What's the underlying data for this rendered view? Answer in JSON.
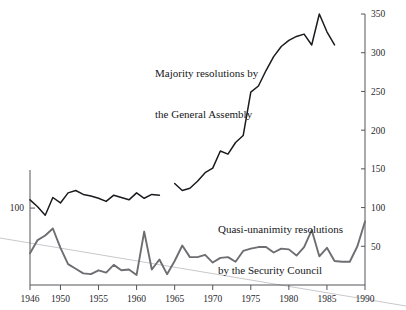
{
  "chart_data": {
    "type": "line",
    "title": "",
    "subtitle": "",
    "xlabel": "",
    "ylabel": "",
    "xlim": [
      1946,
      1990
    ],
    "grid": false,
    "legend_position": "inline-annotations",
    "axes": {
      "right": {
        "label": "",
        "ylim": [
          0,
          350
        ],
        "ticks": [
          50,
          100,
          150,
          200,
          250,
          300,
          350
        ],
        "tick_labels": [
          "50",
          "100",
          "150",
          "200",
          "250",
          "300",
          "350"
        ]
      },
      "left": {
        "label": "",
        "ticks": [
          100
        ],
        "tick_labels": [
          "100"
        ]
      },
      "bottom": {
        "ticks": [
          1946,
          1950,
          1955,
          1960,
          1965,
          1970,
          1975,
          1980,
          1985,
          1990
        ],
        "tick_labels": [
          "1946",
          "1950",
          "1955",
          "1960",
          "1965",
          "1970",
          "1975",
          "1980",
          "1985",
          "1990"
        ]
      }
    },
    "annotations": [
      {
        "name": "general-assembly-label",
        "line1": "Majority resolutions by",
        "line2": "the General Assembly"
      },
      {
        "name": "security-council-label",
        "line1": "Quasi-unanimity resolutions",
        "line2": "by the Security Council"
      }
    ],
    "series": [
      {
        "name": "Majority resolutions by the General Assembly",
        "color": "#1b1b1f",
        "x": [
          1946,
          1947,
          1948,
          1949,
          1950,
          1951,
          1952,
          1953,
          1954,
          1955,
          1956,
          1957,
          1958,
          1959,
          1960,
          1961,
          1962,
          1963,
          1965,
          1966,
          1967,
          1968,
          1969,
          1970,
          1971,
          1972,
          1973,
          1974,
          1975,
          1976,
          1977,
          1978,
          1979,
          1980,
          1981,
          1982,
          1983,
          1984,
          1985,
          1986
        ],
        "values": [
          110,
          101,
          90,
          113,
          106,
          119,
          122,
          117,
          115,
          112,
          108,
          116,
          113,
          110,
          119,
          112,
          117,
          116,
          131,
          122,
          125,
          134,
          145,
          151,
          173,
          169,
          184,
          193,
          249,
          257,
          277,
          295,
          308,
          316,
          321,
          324,
          310,
          350,
          327,
          310
        ]
      },
      {
        "name": "Quasi-unanimity resolutions by the Security Council",
        "color": "#6e6e72",
        "x": [
          1946,
          1947,
          1948,
          1949,
          1950,
          1951,
          1952,
          1953,
          1954,
          1955,
          1956,
          1957,
          1958,
          1959,
          1960,
          1961,
          1962,
          1963,
          1964,
          1965,
          1966,
          1967,
          1968,
          1969,
          1970,
          1971,
          1972,
          1973,
          1974,
          1975,
          1976,
          1977,
          1978,
          1979,
          1980,
          1981,
          1982,
          1983,
          1984,
          1985,
          1986,
          1987,
          1988,
          1989,
          1990
        ],
        "values": [
          41,
          58,
          64,
          73,
          48,
          27,
          21,
          15,
          14,
          19,
          16,
          26,
          19,
          20,
          13,
          69,
          20,
          33,
          14,
          31,
          51,
          36,
          36,
          39,
          29,
          35,
          36,
          30,
          44,
          47,
          49,
          49,
          42,
          47,
          46,
          38,
          49,
          71,
          37,
          48,
          31,
          30,
          30,
          50,
          82
        ]
      }
    ],
    "trend_line": {
      "name": "faint-diagonal-reference-line",
      "color": "#c9c9cc",
      "from": [
        0,
        238
      ],
      "to": [
        406,
        306
      ],
      "description": "faint straight gray line spanning the full image, descending left to right"
    }
  },
  "colors": {
    "background": "#ffffff",
    "axis": "#55555a",
    "general_assembly": "#1b1b1f",
    "security_council": "#6e6e72",
    "trend": "#c9c9cc",
    "text": "#16161a"
  }
}
